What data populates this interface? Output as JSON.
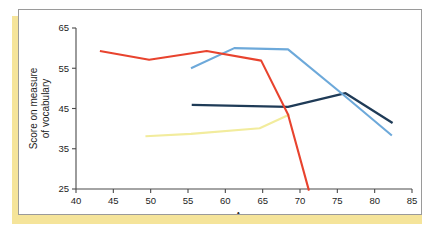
{
  "figure": {
    "accent_color": "#f5e49a",
    "frame_border_color": "#9a9a9a",
    "background": "#ffffff"
  },
  "chart_data": {
    "type": "line",
    "title": "",
    "xlabel": "Age",
    "ylabel": "Score on measure of vocabulary",
    "ylabel_line1": "Score on measure",
    "ylabel_line2": "of vocabulary",
    "xlim": [
      40,
      85
    ],
    "ylim": [
      25,
      65
    ],
    "xticks": [
      40,
      45,
      50,
      55,
      60,
      65,
      70,
      75,
      80,
      85
    ],
    "yticks": [
      25,
      35,
      45,
      55,
      65
    ],
    "grid": false,
    "legend": "none",
    "series": [
      {
        "name": "red-cohort",
        "color": "#e8432e",
        "width": 2.1,
        "x": [
          43.2,
          49.8,
          57.5,
          64.8,
          68.4,
          71.2
        ],
        "values": [
          59.3,
          57.1,
          59.3,
          56.9,
          43.5,
          24.6
        ]
      },
      {
        "name": "light-blue-cohort",
        "color": "#6da9da",
        "width": 2.1,
        "x": [
          55.4,
          61.2,
          68.4,
          76.0,
          82.3
        ],
        "values": [
          55.0,
          60.0,
          59.7,
          48.1,
          38.3
        ]
      },
      {
        "name": "navy-cohort",
        "color": "#1f3b57",
        "width": 2.3,
        "x": [
          55.5,
          68.4,
          76.1,
          82.4
        ],
        "values": [
          45.9,
          45.4,
          48.8,
          41.4
        ]
      },
      {
        "name": "pale-yellow-cohort",
        "color": "#f2ec9d",
        "width": 2.1,
        "x": [
          49.3,
          55.4,
          64.6,
          68.6
        ],
        "values": [
          38.1,
          38.7,
          40.1,
          43.5
        ]
      }
    ]
  }
}
